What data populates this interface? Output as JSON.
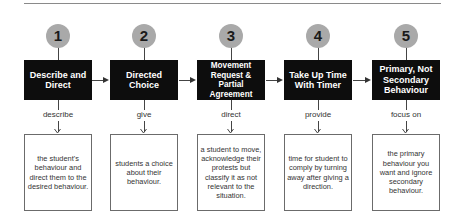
{
  "diagram": {
    "type": "process-flow",
    "steps": [
      {
        "number": "1",
        "title": "Describe and Direct",
        "verb": "describe",
        "description": "the student's behaviour and direct them to the desired behaviour."
      },
      {
        "number": "2",
        "title": "Directed Choice",
        "verb": "give",
        "description": "students a choice about their behaviour."
      },
      {
        "number": "3",
        "title": "Movement Request & Partial Agreement",
        "verb": "direct",
        "description": "a student to move, acknowledge their protests but classify it as not relevant to the situation."
      },
      {
        "number": "4",
        "title": "Take Up Time With Timer",
        "verb": "provide",
        "description": "time for student to comply by turning away after giving a direction."
      },
      {
        "number": "5",
        "title": "Primary, Not Secondary Behaviour",
        "verb": "focus on",
        "description": "the primary behaviour you want and ignore secondary behaviour."
      }
    ],
    "colors": {
      "circle": "#a9a9a9",
      "header_box": "#0d0d0d",
      "header_text": "#ffffff",
      "description_border": "#6b6b6b",
      "connector": "#444444"
    }
  }
}
